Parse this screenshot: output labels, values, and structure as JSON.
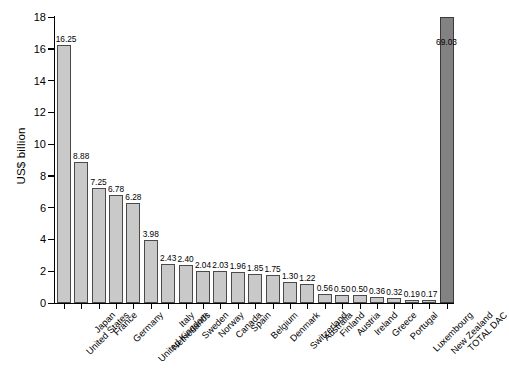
{
  "chart_data": {
    "type": "bar",
    "title": "",
    "subtitle": "",
    "xlabel": "",
    "ylabel": "US$ billion",
    "ylim": [
      0,
      18
    ],
    "yticks": [
      0,
      2,
      4,
      6,
      8,
      10,
      12,
      14,
      16,
      18
    ],
    "grid": false,
    "legend": "none",
    "value_label_format": "2 decimals",
    "note": "Final bar 'TOTAL DAC' is drawn clipped/truncated at the axis maximum; its true value 69.03 is printed on the bar.",
    "categories": [
      "United States",
      "Japan",
      "France",
      "Germany",
      "United Kingdom",
      "Netherlands",
      "Italy",
      "Sweden",
      "Norway",
      "Canada",
      "Spain",
      "Belgium",
      "Denmark",
      "Switzerland",
      "Australia",
      "Finland",
      "Austria",
      "Ireland",
      "Greece",
      "Portugal",
      "Luxembourg",
      "New Zealand",
      "TOTAL DAC"
    ],
    "values": [
      16.25,
      8.88,
      7.25,
      6.78,
      6.28,
      3.98,
      2.43,
      2.4,
      2.04,
      2.03,
      1.96,
      1.85,
      1.75,
      1.3,
      1.22,
      0.56,
      0.5,
      0.5,
      0.36,
      0.32,
      0.19,
      0.17,
      69.03
    ],
    "value_labels": [
      "16.25",
      "8.88",
      "7.25",
      "6.78",
      "6.28",
      "3.98",
      "2.43",
      "2.40",
      "2.04",
      "2.03",
      "1.96",
      "1.85",
      "1.75",
      "1.30",
      "1.22",
      "0.56",
      "0.50",
      "0.50",
      "0.36",
      "0.32",
      "0.19",
      "0.17",
      "69.03"
    ],
    "ytick_labels": [
      "0",
      "2",
      "4",
      "6",
      "8",
      "10",
      "12",
      "14",
      "16",
      "18"
    ],
    "colors": {
      "bar_fill": "#c9c9c9",
      "bar_edge": "#4a4a4a",
      "total_fill": "#828282",
      "total_edge": "#3a3a3a",
      "axis": "#000000",
      "background": "#ffffff",
      "text": "#000000"
    }
  }
}
